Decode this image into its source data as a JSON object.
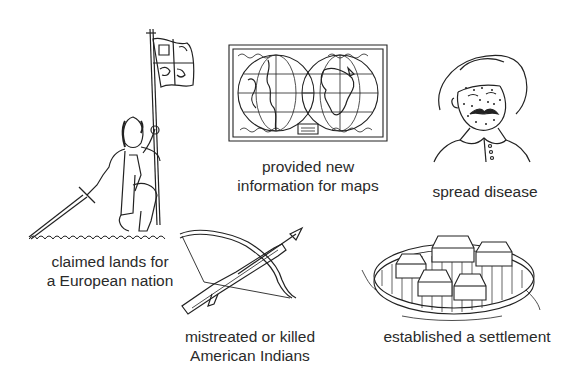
{
  "figure": {
    "panels": [
      {
        "id": "explorer",
        "illustration": "explorer-with-flag-icon",
        "caption_lines": [
          "claimed lands for",
          "a European nation"
        ]
      },
      {
        "id": "map",
        "illustration": "world-map-icon",
        "caption_lines": [
          "provided new",
          "information for maps"
        ]
      },
      {
        "id": "disease",
        "illustration": "sick-man-icon",
        "caption_lines": [
          "spread disease"
        ]
      },
      {
        "id": "crossbow",
        "illustration": "crossbow-icon",
        "caption_lines": [
          "mistreated or killed",
          "American Indians"
        ]
      },
      {
        "id": "settlement",
        "illustration": "fort-settlement-icon",
        "caption_lines": [
          "established a settlement"
        ]
      }
    ]
  }
}
